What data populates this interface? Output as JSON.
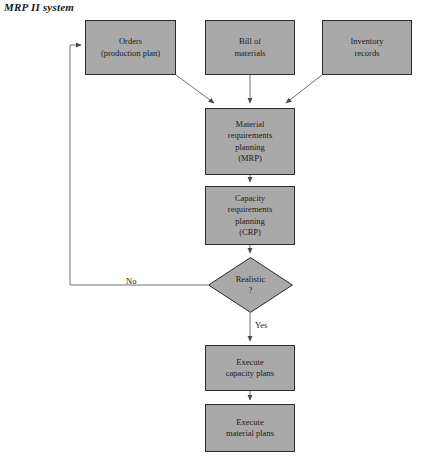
{
  "figure": {
    "title": "MRP II system",
    "caption": ""
  },
  "colors": {
    "node_fill": "#a9a9a9",
    "node_stroke": "#2b2b2b",
    "edge_stroke": "#6e6e6e",
    "text": "#1b1b1b",
    "background": "#ffffff"
  },
  "nodes": [
    {
      "id": "orders",
      "shape": "rect",
      "text": "Orders\n(production plan)",
      "x": 85,
      "y": 20,
      "w": 91,
      "h": 55
    },
    {
      "id": "bill-of-materials",
      "shape": "rect",
      "text": "Bill of\nmaterials",
      "x": 205,
      "y": 20,
      "w": 90,
      "h": 55
    },
    {
      "id": "inventory-records",
      "shape": "rect",
      "text": "Inventory\nrecords",
      "x": 322,
      "y": 20,
      "w": 90,
      "h": 55
    },
    {
      "id": "mrp",
      "shape": "rect",
      "text": "Material\nrequirements\nplanning\n(MRP)",
      "x": 205,
      "y": 108,
      "w": 90,
      "h": 67
    },
    {
      "id": "crp",
      "shape": "rect",
      "text": "Capacity\nrequirements\nplanning\n(CRP)",
      "x": 205,
      "y": 186,
      "w": 90,
      "h": 59
    },
    {
      "id": "realistic",
      "shape": "diamond",
      "text": "Realistic",
      "text2": "?",
      "x": 208,
      "y": 257,
      "w": 85,
      "h": 56
    },
    {
      "id": "execute-capacity-plans",
      "shape": "rect",
      "text": "Execute\ncapacity plans",
      "x": 205,
      "y": 345,
      "w": 90,
      "h": 46
    },
    {
      "id": "execute-material-plans",
      "shape": "rect",
      "text": "Execute\nmaterial plans",
      "x": 205,
      "y": 404,
      "w": 90,
      "h": 48
    }
  ],
  "edge_labels": [
    {
      "id": "no",
      "text": "No",
      "x": 126,
      "y": 276
    },
    {
      "id": "yes",
      "text": "Yes",
      "x": 255,
      "y": 320
    }
  ]
}
